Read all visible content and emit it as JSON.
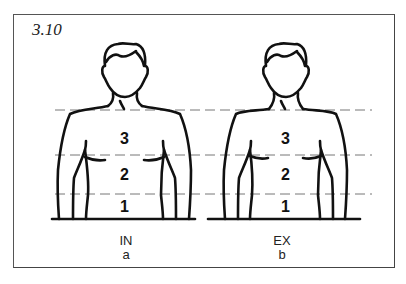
{
  "figure": {
    "number": "3.10",
    "line_color": "#111111",
    "dash_color": "#777777"
  },
  "panels": [
    {
      "id": "a",
      "state": "IN",
      "letter": "a",
      "zones": [
        "3",
        "2",
        "1"
      ]
    },
    {
      "id": "b",
      "state": "EX",
      "letter": "b",
      "zones": [
        "3",
        "2",
        "1"
      ]
    }
  ]
}
